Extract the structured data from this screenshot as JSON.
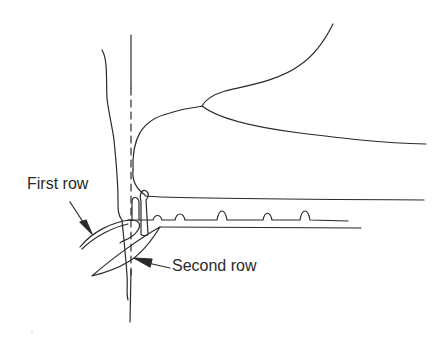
{
  "diagram": {
    "labels": {
      "first_row": "First row",
      "second_row": "Second row"
    },
    "colors": {
      "line": "#2a2a2a",
      "background": "#ffffff"
    }
  }
}
